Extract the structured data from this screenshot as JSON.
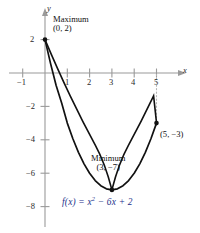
{
  "figure": {
    "title": "Graph of a quadratic function on a closed interval",
    "axis_labels": {
      "x": "x",
      "y": "y"
    }
  },
  "annotations": {
    "maximum": {
      "label": "Maximum",
      "point": "(0, 2)"
    },
    "minimum": {
      "label": "Minimum",
      "point": "(3, −7)"
    },
    "endpoint": {
      "point": "(5, −3)"
    },
    "equation_plain": "f(x) = x² − 6x + 2",
    "equation": {
      "fx": "f(x)",
      "eq": "=",
      "term1_base": "x",
      "term1_exp": "2",
      "term2": "− 6x",
      "term3": "+ 2"
    }
  },
  "colors": {
    "curve": "#111111",
    "axis": "#9a9a9a",
    "equation": "#1b2f8a",
    "point": "#111111",
    "dotted": "#b5b5b5",
    "background": "#ffffff"
  },
  "chart_data": {
    "type": "line",
    "title": "",
    "subtitle": "",
    "xlabel": "x",
    "ylabel": "y",
    "function": "f(x) = x^2 - 6x + 2",
    "domain": [
      0,
      5
    ],
    "xlim": [
      -1.6,
      6.0
    ],
    "ylim": [
      -9.0,
      3.3
    ],
    "xticks": [
      -1,
      1,
      2,
      3,
      4,
      5
    ],
    "xtick_labels": [
      "−1",
      "1",
      "2",
      "3",
      "4",
      "5"
    ],
    "yticks": [
      2,
      -2,
      -4,
      -6,
      -8
    ],
    "ytick_labels": [
      "2",
      "−2",
      "−4",
      "−6",
      "−8"
    ],
    "grid": false,
    "legend": false,
    "series": [
      {
        "name": "f(x) = x^2 - 6x + 2",
        "x": [
          0,
          0.25,
          0.5,
          0.75,
          1,
          1.25,
          1.5,
          1.75,
          2,
          2.25,
          2.5,
          2.75,
          3,
          3.25,
          3.5,
          3.75,
          4,
          4.25,
          4.5,
          4.75,
          5
        ],
        "values": [
          2,
          0.5625,
          -0.75,
          -1.8125,
          -3,
          -3.9375,
          -4.75,
          -5.4375,
          -6,
          -6.4375,
          -6.75,
          -6.9375,
          -7,
          -6.9375,
          -6.75,
          -6.4375,
          -6,
          -5.4375,
          -4.75,
          -3.9375,
          -3
        ]
      }
    ],
    "points": [
      {
        "label": "Maximum",
        "coords": [
          0,
          2
        ],
        "text": "(0, 2)"
      },
      {
        "label": "Minimum",
        "coords": [
          3,
          -7
        ],
        "text": "(3, −7)"
      },
      {
        "label": "Endpoint",
        "coords": [
          5,
          -3
        ],
        "text": "(5, −3)"
      }
    ],
    "annotations": [
      {
        "text": "Maximum",
        "at": [
          0,
          2
        ]
      },
      {
        "text": "(0, 2)",
        "at": [
          0,
          2
        ]
      },
      {
        "text": "Minimum",
        "at": [
          3,
          -7
        ]
      },
      {
        "text": "(3, −7)",
        "at": [
          3,
          -7
        ]
      },
      {
        "text": "(5, −3)",
        "at": [
          5,
          -3
        ]
      },
      {
        "text": "f(x) = x² − 6x + 2",
        "at": [
          2.6,
          -8.2
        ]
      }
    ],
    "guides": [
      {
        "type": "dotted-vertical",
        "x": 5,
        "y_from": 0,
        "y_to": -3
      }
    ]
  }
}
